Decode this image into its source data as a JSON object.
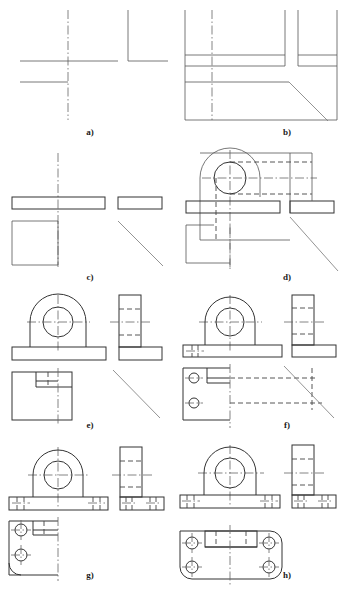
{
  "figure": {
    "type": "engineering-drawing",
    "sheet_width_px": 344,
    "sheet_height_px": 594,
    "background_color": "#ffffff",
    "line_colors": {
      "visible_outline": "#333333",
      "hidden_dashed": "#444444",
      "center_dash_dot": "#666666",
      "projection_thin": "#777777",
      "caption_text": "#1a1a1a"
    },
    "panel_count": 8,
    "grid": {
      "columns": 2,
      "rows": 4
    }
  },
  "captions": [
    {
      "id": "a",
      "label": "a)"
    },
    {
      "id": "b",
      "label": "b)"
    },
    {
      "id": "c",
      "label": "c)"
    },
    {
      "id": "d",
      "label": "d)"
    },
    {
      "id": "e",
      "label": "e)"
    },
    {
      "id": "f",
      "label": "f)"
    },
    {
      "id": "g",
      "label": "g)"
    },
    {
      "id": "h",
      "label": "h)"
    }
  ],
  "panels": [
    {
      "id": "a",
      "label": "a)",
      "row": 1,
      "col": 1,
      "description": "Centre lines and base reference lines laid out for front, top and side views",
      "elements": [
        "vertical-centre-line",
        "horizontal-base-line",
        "secondary-base-line",
        "side-view-corner"
      ]
    },
    {
      "id": "b",
      "label": "b)",
      "row": 1,
      "col": 2,
      "description": "Overall bounding rectangles blocked in for all three views with 45 degree mitre line",
      "elements": [
        "front-view-box",
        "top-view-box",
        "side-view-box",
        "mitre-line-45"
      ]
    },
    {
      "id": "c",
      "label": "c)",
      "row": 2,
      "col": 1,
      "description": "Base plate profile drawn in front and side views, top view outline squared off",
      "elements": [
        "base-plate-front",
        "base-plate-side",
        "top-view-square",
        "mitre-line-45"
      ]
    },
    {
      "id": "d",
      "label": "d)",
      "row": 2,
      "col": 2,
      "description": "Boss and bore circles added with projection and hidden lines carried to the side view",
      "elements": [
        "boss-arc",
        "bore-circle",
        "hidden-bore-lines",
        "projection-lines",
        "mitre-line-45"
      ]
    },
    {
      "id": "e",
      "label": "e)",
      "row": 3,
      "col": 1,
      "description": "Front view finished with boss, bore and base plate; side view stepped profile completed",
      "elements": [
        "boss-semicircle",
        "bore-circle",
        "base-plate",
        "side-view-L-profile",
        "top-view-step"
      ]
    },
    {
      "id": "f",
      "label": "f)",
      "row": 3,
      "col": 2,
      "description": "Bolt holes located in the base flange and projected into the top view",
      "elements": [
        "bolt-hole-left",
        "bolt-hole-top-view",
        "hidden-projection-lines",
        "mitre-line-45"
      ]
    },
    {
      "id": "g",
      "label": "g)",
      "row": 4,
      "col": 1,
      "description": "Bolt holes shown as hidden detail in front and side views, two holes in top view",
      "elements": [
        "bolt-holes-front-hidden",
        "bolt-holes-side-hidden",
        "top-view-bolt-circles"
      ]
    },
    {
      "id": "h",
      "label": "h)",
      "row": 4,
      "col": 2,
      "description": "Completed three view drawing with four bolt holes, rounded flange corners and all centre lines",
      "elements": [
        "completed-front-view",
        "completed-side-view",
        "completed-top-view",
        "four-bolt-holes",
        "rounded-corners"
      ]
    }
  ]
}
